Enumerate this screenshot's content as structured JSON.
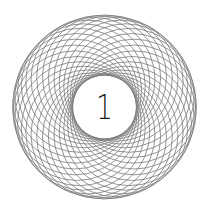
{
  "emblem": {
    "numeral": "1",
    "pattern": {
      "type": "rosette",
      "center": [
        104.5,
        107
      ],
      "ring_radius": 30,
      "circle_radius": 62,
      "count": 32,
      "stroke_color": "#7a7a7a",
      "stroke_width": 0.8
    },
    "numeral_color": "#1a1a1a",
    "background": "#ffffff"
  }
}
